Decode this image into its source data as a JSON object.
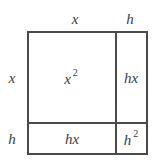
{
  "diagram": {
    "title": "",
    "type": "area-model-square",
    "colors": {
      "line": "#4a4a4a",
      "text": "#3c3c3c",
      "background": "#ffffff"
    },
    "top_labels": [
      {
        "text": "x",
        "x": 75,
        "y": 19
      },
      {
        "text": "h",
        "x": 130,
        "y": 19
      }
    ],
    "side_labels": [
      {
        "text": "x",
        "x": 12,
        "y": 78
      },
      {
        "text": "h",
        "x": 12,
        "y": 139
      }
    ],
    "cells": [
      {
        "id": "x-squared",
        "base": "x",
        "exp": "2",
        "x": 71,
        "y": 78
      },
      {
        "id": "hx-right",
        "base": "hx",
        "exp": "",
        "x": 131,
        "y": 78
      },
      {
        "id": "hx-bottom",
        "base": "hx",
        "exp": "",
        "x": 72,
        "y": 139
      },
      {
        "id": "h-squared",
        "base": "h",
        "exp": "2",
        "x": 131,
        "y": 139
      }
    ]
  }
}
